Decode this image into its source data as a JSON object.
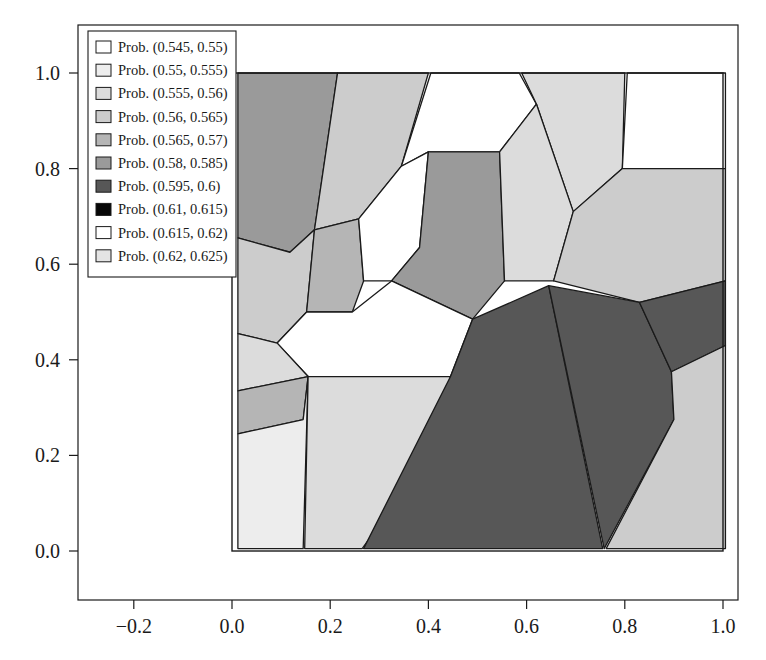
{
  "chart_data": {
    "type": "map",
    "title": "",
    "subtitle": "",
    "xlabel": "",
    "ylabel": "",
    "xlim": [
      -0.3,
      1.07
    ],
    "ylim": [
      -0.1,
      1.09
    ],
    "xticks": [
      "-0.2",
      "0.0",
      "0.2",
      "0.4",
      "0.6",
      "0.8",
      "1.0"
    ],
    "xtick_values": [
      -0.2,
      0.0,
      0.2,
      0.4,
      0.6,
      0.8,
      1.0
    ],
    "yticks": [
      "0.0",
      "0.2",
      "0.4",
      "0.6",
      "0.8",
      "1.0"
    ],
    "ytick_values": [
      0.0,
      0.2,
      0.4,
      0.6,
      0.8,
      1.0
    ],
    "grid": false,
    "legend_position": "upper-left",
    "domain_box": {
      "x0": 0.0,
      "y0": 0.0,
      "x1": 1.0,
      "y1": 1.0
    },
    "legend": [
      {
        "label": "Prob. (0.545, 0.55)",
        "color": "#ffffff",
        "range": [
          0.545,
          0.55
        ]
      },
      {
        "label": "Prob. (0.55, 0.555)",
        "color": "#ededed",
        "range": [
          0.55,
          0.555
        ]
      },
      {
        "label": "Prob. (0.555, 0.56)",
        "color": "#dcdcdc",
        "range": [
          0.555,
          0.56
        ]
      },
      {
        "label": "Prob. (0.56, 0.565)",
        "color": "#cccccc",
        "range": [
          0.56,
          0.565
        ]
      },
      {
        "label": "Prob. (0.565, 0.57)",
        "color": "#b5b5b5",
        "range": [
          0.565,
          0.57
        ]
      },
      {
        "label": "Prob. (0.58, 0.585)",
        "color": "#9a9a9a",
        "range": [
          0.58,
          0.585
        ]
      },
      {
        "label": "Prob. (0.595, 0.6)",
        "color": "#575757",
        "range": [
          0.595,
          0.6
        ]
      },
      {
        "label": "Prob. (0.61, 0.615)",
        "color": "#070707",
        "range": [
          0.61,
          0.615
        ]
      },
      {
        "label": "Prob. (0.615, 0.62)",
        "color": "#ffffff",
        "range": [
          0.615,
          0.62
        ]
      },
      {
        "label": "Prob. (0.62, 0.625)",
        "color": "#e4e4e4",
        "range": [
          0.62,
          0.625
        ]
      }
    ],
    "cells": [
      {
        "id": "cell-01",
        "color": "#9a9a9a",
        "points": [
          [
            0.012,
            1.0
          ],
          [
            0.215,
            1.0
          ],
          [
            0.168,
            0.672
          ],
          [
            0.118,
            0.625
          ],
          [
            0.012,
            0.655
          ]
        ]
      },
      {
        "id": "cell-02",
        "color": "#cccccc",
        "points": [
          [
            0.215,
            1.0
          ],
          [
            0.4,
            1.0
          ],
          [
            0.345,
            0.805
          ],
          [
            0.258,
            0.695
          ],
          [
            0.168,
            0.672
          ]
        ]
      },
      {
        "id": "cell-03",
        "color": "#ffffff",
        "points": [
          [
            0.405,
            1.0
          ],
          [
            0.585,
            1.0
          ],
          [
            0.62,
            0.935
          ],
          [
            0.545,
            0.835
          ],
          [
            0.4,
            0.835
          ],
          [
            0.345,
            0.805
          ]
        ]
      },
      {
        "id": "cell-04",
        "color": "#dcdcdc",
        "points": [
          [
            0.59,
            1.0
          ],
          [
            0.8,
            1.0
          ],
          [
            0.795,
            0.8
          ],
          [
            0.695,
            0.71
          ],
          [
            0.62,
            0.935
          ]
        ]
      },
      {
        "id": "cell-05",
        "color": "#ffffff",
        "points": [
          [
            0.805,
            1.0
          ],
          [
            1.005,
            1.0
          ],
          [
            1.005,
            0.8
          ],
          [
            0.795,
            0.8
          ]
        ]
      },
      {
        "id": "cell-06",
        "color": "#cccccc",
        "points": [
          [
            0.012,
            0.655
          ],
          [
            0.118,
            0.625
          ],
          [
            0.168,
            0.672
          ],
          [
            0.152,
            0.5
          ],
          [
            0.092,
            0.435
          ],
          [
            0.012,
            0.455
          ]
        ]
      },
      {
        "id": "cell-07",
        "color": "#b5b5b5",
        "points": [
          [
            0.168,
            0.672
          ],
          [
            0.258,
            0.695
          ],
          [
            0.268,
            0.565
          ],
          [
            0.245,
            0.5
          ],
          [
            0.152,
            0.5
          ]
        ]
      },
      {
        "id": "cell-08",
        "color": "#ffffff",
        "points": [
          [
            0.268,
            0.565
          ],
          [
            0.258,
            0.695
          ],
          [
            0.345,
            0.805
          ],
          [
            0.4,
            0.835
          ],
          [
            0.382,
            0.635
          ],
          [
            0.325,
            0.565
          ]
        ]
      },
      {
        "id": "cell-09",
        "color": "#9a9a9a",
        "points": [
          [
            0.325,
            0.565
          ],
          [
            0.382,
            0.635
          ],
          [
            0.4,
            0.835
          ],
          [
            0.545,
            0.835
          ],
          [
            0.555,
            0.565
          ],
          [
            0.49,
            0.485
          ]
        ]
      },
      {
        "id": "cell-10",
        "color": "#dcdcdc",
        "points": [
          [
            0.545,
            0.835
          ],
          [
            0.62,
            0.935
          ],
          [
            0.695,
            0.71
          ],
          [
            0.655,
            0.565
          ],
          [
            0.555,
            0.565
          ]
        ]
      },
      {
        "id": "cell-11",
        "color": "#cccccc",
        "points": [
          [
            0.655,
            0.565
          ],
          [
            0.695,
            0.71
          ],
          [
            0.795,
            0.8
          ],
          [
            1.005,
            0.8
          ],
          [
            1.005,
            0.565
          ],
          [
            0.83,
            0.52
          ]
        ]
      },
      {
        "id": "cell-12",
        "color": "#ffffff",
        "points": [
          [
            0.092,
            0.435
          ],
          [
            0.152,
            0.5
          ],
          [
            0.245,
            0.5
          ],
          [
            0.325,
            0.565
          ],
          [
            0.49,
            0.485
          ],
          [
            0.445,
            0.365
          ],
          [
            0.155,
            0.365
          ]
        ]
      },
      {
        "id": "cell-13",
        "color": "#dcdcdc",
        "points": [
          [
            0.012,
            0.455
          ],
          [
            0.092,
            0.435
          ],
          [
            0.155,
            0.365
          ],
          [
            0.012,
            0.335
          ]
        ]
      },
      {
        "id": "cell-14",
        "color": "#b5b5b5",
        "points": [
          [
            0.012,
            0.335
          ],
          [
            0.155,
            0.365
          ],
          [
            0.145,
            0.275
          ],
          [
            0.012,
            0.245
          ]
        ]
      },
      {
        "id": "cell-15",
        "color": "#ededed",
        "points": [
          [
            0.012,
            0.245
          ],
          [
            0.145,
            0.275
          ],
          [
            0.155,
            0.365
          ],
          [
            0.145,
            0.005
          ],
          [
            0.012,
            0.005
          ]
        ]
      },
      {
        "id": "cell-16",
        "color": "#dcdcdc",
        "points": [
          [
            0.155,
            0.365
          ],
          [
            0.445,
            0.365
          ],
          [
            0.4,
            0.195
          ],
          [
            0.265,
            0.005
          ],
          [
            0.148,
            0.005
          ]
        ]
      },
      {
        "id": "cell-17",
        "color": "#575757",
        "points": [
          [
            0.445,
            0.365
          ],
          [
            0.49,
            0.485
          ],
          [
            0.645,
            0.555
          ],
          [
            0.755,
            0.005
          ],
          [
            0.268,
            0.005
          ]
        ]
      },
      {
        "id": "cell-18",
        "color": "#575757",
        "points": [
          [
            0.645,
            0.555
          ],
          [
            0.83,
            0.52
          ],
          [
            0.895,
            0.375
          ],
          [
            0.9,
            0.275
          ],
          [
            0.758,
            0.005
          ]
        ]
      },
      {
        "id": "cell-19",
        "color": "#575757",
        "points": [
          [
            0.83,
            0.52
          ],
          [
            1.005,
            0.565
          ],
          [
            1.005,
            0.43
          ],
          [
            0.895,
            0.375
          ]
        ]
      },
      {
        "id": "cell-20",
        "color": "#cccccc",
        "points": [
          [
            0.895,
            0.375
          ],
          [
            1.005,
            0.43
          ],
          [
            1.005,
            0.005
          ],
          [
            0.762,
            0.005
          ],
          [
            0.9,
            0.275
          ]
        ]
      }
    ]
  }
}
